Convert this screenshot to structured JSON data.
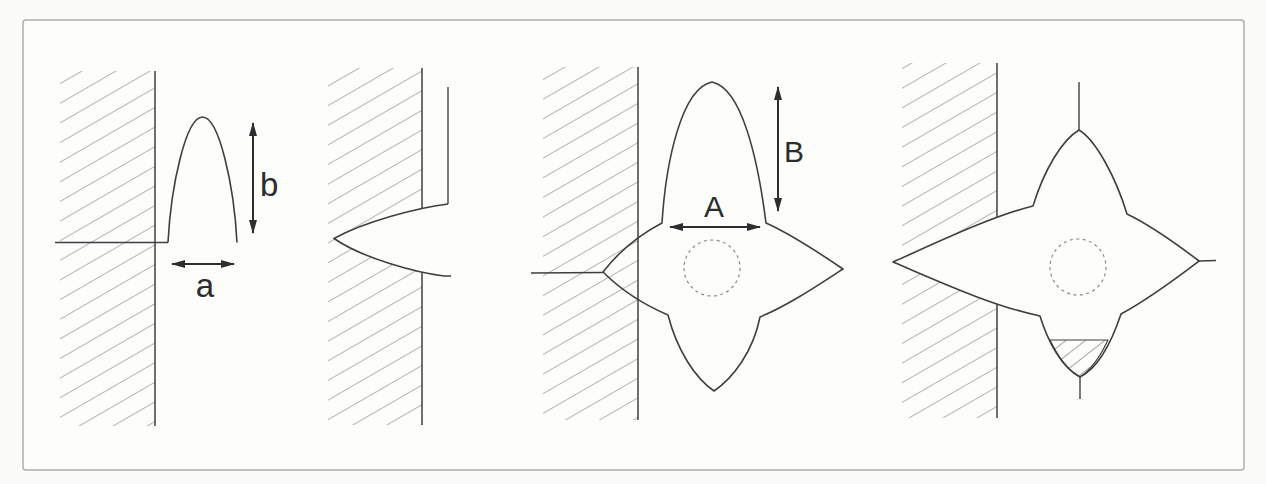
{
  "figure": {
    "description_labels": {
      "a": "a",
      "b": "b",
      "A": "A",
      "B": "B"
    },
    "colors": {
      "background": "#fbfbf9",
      "paper": "#fdfdfc",
      "frame": "#b0afac",
      "outline": "#3f3f3f",
      "hatch": "#787878",
      "dashed_circle": "#8a8a8a",
      "text": "#2c2c2c"
    }
  }
}
